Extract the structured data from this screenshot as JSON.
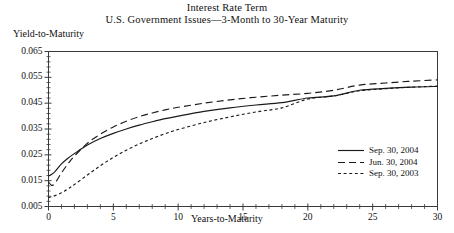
{
  "figure": {
    "title_line1": "Interest Rate Term",
    "title_line2": "U.S. Government Issues—3-Month to 30-Year Maturity",
    "ylabel": "Yield-to-Maturity",
    "xlabel": "Years-to-Maturity",
    "frame_color": "#3a3a3a",
    "line_color": "#1a1a1a",
    "background": "#ffffff"
  },
  "chart_data": {
    "type": "line",
    "title": "Interest Rate Term",
    "subtitle": "U.S. Government Issues—3-Month to 30-Year Maturity",
    "xlabel": "Years-to-Maturity",
    "ylabel": "Yield-to-Maturity",
    "xlim": [
      0,
      30
    ],
    "ylim": [
      0.005,
      0.065
    ],
    "xticks": [
      0,
      5,
      10,
      15,
      20,
      25,
      30
    ],
    "xtick_labels": [
      "0",
      "5",
      "10",
      "15",
      "20",
      "25",
      "30"
    ],
    "xminor_step": 1,
    "yticks": [
      0.005,
      0.015,
      0.025,
      0.035,
      0.045,
      0.055,
      0.065
    ],
    "ytick_labels": [
      "0.005",
      "0.015",
      "0.025",
      "0.035",
      "0.045",
      "0.055",
      "0.065"
    ],
    "yminor_step": 0.002,
    "grid": false,
    "legend_position": "lower right",
    "series": [
      {
        "name": "Sep. 30, 2004",
        "style": "solid",
        "dash": "none",
        "x": [
          0,
          0.25,
          0.5,
          1,
          1.5,
          2,
          3,
          4,
          5,
          6,
          7,
          8,
          9,
          10,
          12,
          14,
          16,
          18,
          20,
          22,
          24,
          26,
          28,
          30
        ],
        "y": [
          0.0168,
          0.0175,
          0.0185,
          0.0215,
          0.0237,
          0.0255,
          0.0288,
          0.0313,
          0.0333,
          0.035,
          0.0365,
          0.0378,
          0.039,
          0.04,
          0.0418,
          0.0432,
          0.0443,
          0.0452,
          0.047,
          0.0478,
          0.05,
          0.0507,
          0.0512,
          0.0515
        ]
      },
      {
        "name": "Jun. 30, 2004",
        "style": "dashed",
        "dash": "7,4",
        "x": [
          0,
          0.25,
          0.5,
          1,
          1.5,
          2,
          3,
          4,
          5,
          6,
          7,
          8,
          9,
          10,
          12,
          14,
          16,
          18,
          20,
          22,
          24,
          26,
          28,
          30
        ],
        "y": [
          0.0145,
          0.0132,
          0.014,
          0.018,
          0.0215,
          0.0245,
          0.0295,
          0.033,
          0.0358,
          0.038,
          0.0398,
          0.0412,
          0.0424,
          0.0434,
          0.045,
          0.0463,
          0.0473,
          0.0481,
          0.0488,
          0.05,
          0.052,
          0.0528,
          0.0535,
          0.054
        ]
      },
      {
        "name": "Sep. 30, 2003",
        "style": "dotted",
        "dash": "3,2.6",
        "x": [
          0,
          0.25,
          0.5,
          1,
          1.5,
          2,
          3,
          4,
          5,
          6,
          7,
          8,
          9,
          10,
          12,
          14,
          16,
          18,
          20,
          22,
          24,
          26,
          28,
          30
        ],
        "y": [
          0.0085,
          0.0088,
          0.0092,
          0.0103,
          0.0118,
          0.0135,
          0.0172,
          0.0208,
          0.024,
          0.0268,
          0.0292,
          0.0313,
          0.0332,
          0.0348,
          0.0375,
          0.0397,
          0.0416,
          0.0432,
          0.0466,
          0.0478,
          0.0498,
          0.0506,
          0.0512,
          0.0516
        ]
      }
    ]
  },
  "legend": {
    "items": [
      {
        "label": "Sep. 30, 2004",
        "style": "solid"
      },
      {
        "label": "Jun. 30, 2004",
        "style": "dashed"
      },
      {
        "label": "Sep. 30, 2003",
        "style": "dotted"
      }
    ]
  }
}
